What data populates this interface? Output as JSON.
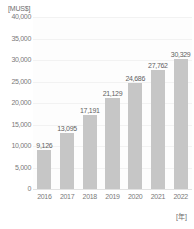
{
  "chart_data": {
    "type": "bar",
    "title": "",
    "xlabel": "[年]",
    "ylabel": "[MUS$]",
    "unit_label": "[MUS$]",
    "categories": [
      "2016",
      "2017",
      "2018",
      "2019",
      "2020",
      "2021",
      "2022"
    ],
    "values": [
      9126,
      13095,
      17191,
      21129,
      24686,
      27762,
      30329
    ],
    "value_labels": [
      "9,126",
      "13,095",
      "17,191",
      "21,129",
      "24,686",
      "27,762",
      "30,329"
    ],
    "ylim": [
      0,
      40000
    ],
    "ytick_values": [
      40000,
      35000,
      30000,
      25000,
      20000,
      15000,
      10000,
      5000,
      0
    ],
    "ytick_labels": [
      "40,000",
      "35,000",
      "30,000",
      "25,000",
      "20,000",
      "15,000",
      "10,000",
      "5,000",
      "0"
    ],
    "grid": true,
    "legend": "none",
    "bar_color": "#c6c6c6",
    "plot_background": "#fdfdfd",
    "gridline_color": "#f2f2f2",
    "axis_text_color": "#7a7a7a",
    "label_text_color": "#5f5f5f"
  }
}
